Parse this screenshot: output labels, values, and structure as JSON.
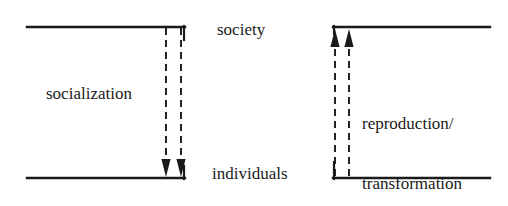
{
  "figure": {
    "name": "society-individuals-transformational-model",
    "background_color": "#ffffff",
    "line_color": "#1a1a1a",
    "text_color": "#1a1a1a",
    "width": 508,
    "height": 206
  },
  "labels": {
    "society": "society",
    "individuals": "individuals",
    "socialization": "socialization",
    "reproduction_line1": "reproduction/",
    "reproduction_line2": "transformation"
  },
  "panels": {
    "left": {
      "name": "socialization-panel",
      "label": "socialization",
      "arrow_direction": "down",
      "arrow_count": 2,
      "from": "society",
      "to": "individuals",
      "top_rule": {
        "x1": 27,
        "x2": 185,
        "y": 27
      },
      "bottom_rule": {
        "x1": 27,
        "x2": 185,
        "y": 178
      },
      "connector_x": 183,
      "dashed_arrows_x": [
        166,
        182
      ]
    },
    "right": {
      "name": "reproduction-transformation-panel",
      "label": "reproduction/ transformation",
      "arrow_direction": "up",
      "arrow_count": 2,
      "from": "individuals",
      "to": "society",
      "top_rule": {
        "x1": 333,
        "x2": 490,
        "y": 27
      },
      "bottom_rule": {
        "x1": 333,
        "x2": 490,
        "y": 178
      },
      "connector_x": 334,
      "dashed_arrows_x": [
        335,
        349
      ]
    }
  },
  "stroke": {
    "solid_width": 2.2,
    "dash_width": 1.8,
    "dash_pattern": "7,5"
  }
}
